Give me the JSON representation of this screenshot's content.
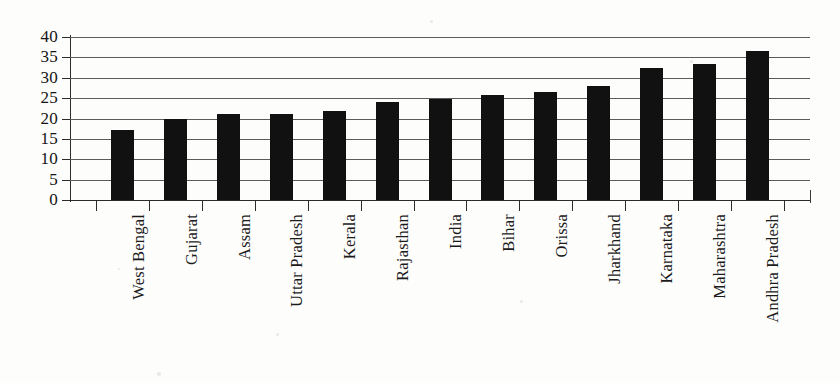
{
  "chart_data": {
    "type": "bar",
    "title": "",
    "subtitle": "",
    "xlabel": "",
    "ylabel": "",
    "ylim": [
      0,
      40
    ],
    "yticks": [
      0,
      5,
      10,
      15,
      20,
      25,
      30,
      35,
      40
    ],
    "ytick_labels": [
      "0",
      "5",
      "10",
      "15",
      "20",
      "25",
      "30",
      "35",
      "40"
    ],
    "grid": "horizontal",
    "legend": "none",
    "bar_color": "#111111",
    "categories": [
      "West Bengal",
      "Gujarat",
      "Assam",
      "Uttar Pradesh",
      "Kerala",
      "Rajasthan",
      "India",
      "Bihar",
      "Orissa",
      "Jharkhand",
      "Karnataka",
      "Maharashtra",
      "Andhra Pradesh"
    ],
    "values": [
      17.3,
      19.8,
      21.1,
      21.2,
      21.9,
      24.1,
      24.7,
      25.8,
      26.5,
      28.0,
      32.5,
      33.3,
      36.5
    ],
    "series": [
      {
        "name": "value",
        "values": [
          17.3,
          19.8,
          21.1,
          21.2,
          21.9,
          24.1,
          24.7,
          25.8,
          26.5,
          28.0,
          32.5,
          33.3,
          36.5
        ]
      }
    ],
    "annotations": []
  },
  "colors": {
    "bar": "#111111",
    "grid": "#5b5b5b",
    "axis": "#2b2b2b",
    "text": "#141414",
    "background": "#fdfdfc"
  }
}
